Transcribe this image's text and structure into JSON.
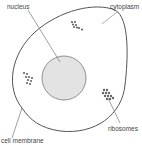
{
  "diagram": {
    "type": "cell diagram",
    "labels": {
      "nucleus": "nucleus",
      "cytoplasm": "cytoplasm",
      "ribosomes": "ribosomes",
      "cell_membrane": "cell membrane"
    },
    "colors": {
      "outline": "#555555",
      "nucleus_fill": "#e3e3e3",
      "ribosome": "#666666",
      "text": "#444444"
    }
  }
}
